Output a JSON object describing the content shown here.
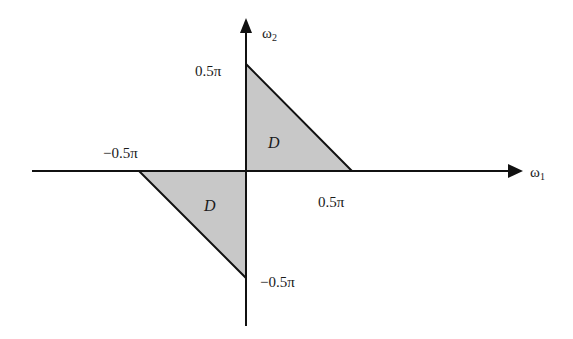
{
  "diagram": {
    "title": "",
    "axes": {
      "horizontal": {
        "label": "ω",
        "subscript": "1"
      },
      "vertical": {
        "label": "ω",
        "subscript": "2"
      }
    },
    "ticks": {
      "top": "0.5π",
      "right": "0.5π",
      "left": "−0.5π",
      "bottom": "−0.5π"
    },
    "regions": [
      {
        "label": "D",
        "quadrant": "upper-right",
        "vertices": [
          [
            0,
            0.5
          ],
          [
            0,
            0
          ],
          [
            0.5,
            0
          ]
        ]
      },
      {
        "label": "D",
        "quadrant": "lower-left",
        "vertices": [
          [
            -0.5,
            0
          ],
          [
            0,
            0
          ],
          [
            0,
            -0.5
          ]
        ]
      }
    ],
    "colors": {
      "fill": "#c8c8c8",
      "stroke": "#111111"
    }
  }
}
